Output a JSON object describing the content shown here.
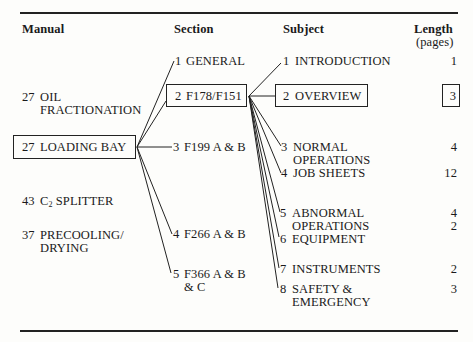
{
  "headers": {
    "manual": "Manual",
    "section": "Section",
    "subject": "Subject",
    "length": "Length",
    "length_unit": "(pages)"
  },
  "manuals": [
    {
      "number": "27",
      "label_line1": "OIL",
      "label_line2": "FRACTIONATION"
    },
    {
      "number": "27",
      "label_line1": "LOADING BAY",
      "highlighted": true
    },
    {
      "number": "43",
      "label_line1": "C",
      "subscript": "2",
      "label_rest": " SPLITTER"
    },
    {
      "number": "37",
      "label_line1": "PRECOOLING/",
      "label_line2": "DRYING"
    }
  ],
  "sections": [
    {
      "number": "1",
      "label_line1": "GENERAL"
    },
    {
      "number": "2",
      "label_line1": "F178/F151",
      "highlighted": true
    },
    {
      "number": "3",
      "label_line1": "F199 A & B"
    },
    {
      "number": "4",
      "label_line1": "F266 A & B"
    },
    {
      "number": "5",
      "label_line1": "F366 A & B",
      "label_line2": "& C"
    }
  ],
  "subjects": [
    {
      "number": "1",
      "label_line1": "INTRODUCTION",
      "length": "1"
    },
    {
      "number": "2",
      "label_line1": "OVERVIEW",
      "length": "3",
      "highlighted": true
    },
    {
      "number": "3",
      "label_line1": "NORMAL",
      "label_line2": "OPERATIONS",
      "length": "4"
    },
    {
      "number": "4",
      "label_line1": "JOB SHEETS",
      "length": "12"
    },
    {
      "number": "5",
      "label_line1": "ABNORMAL",
      "label_line2": "OPERATIONS",
      "length": "4",
      "length2": "2"
    },
    {
      "number": "6",
      "label_line1": "EQUIPMENT",
      "length": ""
    },
    {
      "number": "7",
      "label_line1": "INSTRUMENTS",
      "length": "2"
    },
    {
      "number": "8",
      "label_line1": "SAFETY &",
      "label_line2": "EMERGENCY",
      "length": "3"
    }
  ]
}
